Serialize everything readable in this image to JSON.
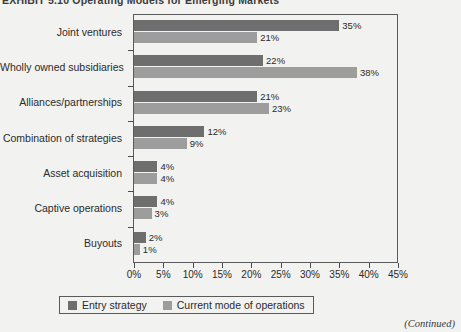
{
  "exhibit": {
    "title": "EXHIBIT 5.10  Operating Models for Emerging Markets",
    "continued_note": "(Continued)"
  },
  "legend": {
    "position": "bottom-center",
    "items": [
      {
        "label": "Entry strategy",
        "color": "#6e6e6e",
        "key": "entry"
      },
      {
        "label": "Current mode of operations",
        "color": "#9d9d9d",
        "key": "current"
      }
    ]
  },
  "axis": {
    "x_ticks": [
      "0%",
      "5%",
      "10%",
      "15%",
      "20%",
      "25%",
      "30%",
      "35%",
      "40%",
      "45%"
    ],
    "x_min": 0,
    "x_max": 45
  },
  "chart_data": {
    "type": "bar",
    "orientation": "horizontal",
    "title": "EXHIBIT 5.10  Operating Models for Emerging Markets",
    "xlabel": "",
    "ylabel": "",
    "xlim": [
      0,
      45
    ],
    "grid": false,
    "legend_position": "bottom",
    "categories": [
      "Joint ventures",
      "Wholly owned subsidiaries",
      "Alliances/partnerships",
      "Combination of strategies",
      "Asset acquisition",
      "Captive operations",
      "Buyouts"
    ],
    "series": [
      {
        "name": "Entry strategy",
        "color": "#6e6e6e",
        "values": [
          35,
          22,
          21,
          12,
          4,
          4,
          2
        ],
        "labels": [
          "35%",
          "22%",
          "21%",
          "12%",
          "4%",
          "4%",
          "2%"
        ]
      },
      {
        "name": "Current mode of operations",
        "color": "#9d9d9d",
        "values": [
          21,
          38,
          23,
          9,
          4,
          3,
          1
        ],
        "labels": [
          "21%",
          "38%",
          "23%",
          "9%",
          "4%",
          "3%",
          "1%"
        ]
      }
    ]
  }
}
